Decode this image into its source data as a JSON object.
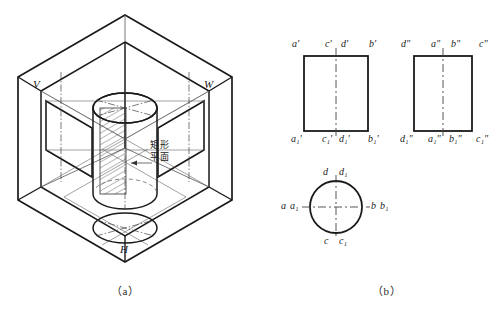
{
  "figure": {
    "title_a": "（a）",
    "title_b": "（b）",
    "annotation_cn_line1": "矩形",
    "annotation_cn_line2": "平面",
    "annotation_cn_full": "矩形平面"
  },
  "isometric": {
    "plane_labels": {
      "v": "V",
      "w": "W",
      "h": "H"
    }
  },
  "front_view": {
    "top_labels": [
      "a'",
      "c'",
      "d'",
      "b'"
    ],
    "bottom_labels": [
      "a₁'",
      "c₁'",
      "d₁'",
      "b₁'"
    ]
  },
  "side_view": {
    "top_labels": [
      "d\"",
      "a\"",
      "b\"",
      "c\""
    ],
    "bottom_labels": [
      "d₁\"",
      "a₁\"",
      "b₁\"",
      "c₁\""
    ]
  },
  "top_view": {
    "top_labels": [
      "d",
      "d₁"
    ],
    "right_labels": [
      "b",
      "b₁"
    ],
    "bottom_labels": [
      "c",
      "c₁"
    ],
    "left_labels": [
      "a",
      "a₁"
    ]
  },
  "colors": {
    "stroke": "#1a1a1a",
    "thin": "#555555",
    "hatch": "#333333",
    "background": "#ffffff"
  }
}
